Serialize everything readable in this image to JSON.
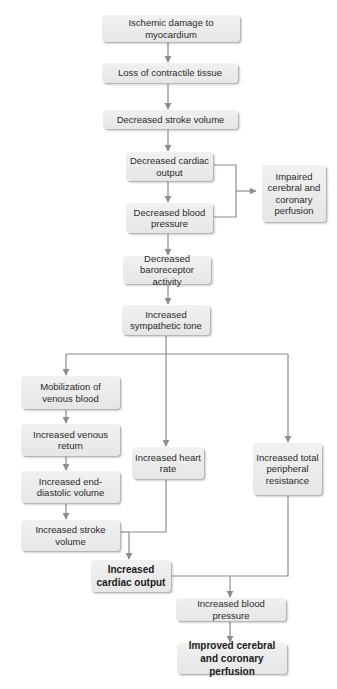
{
  "diagram": {
    "title": "",
    "colors": {
      "box_fill": "#ececec",
      "line": "#8c8c8c",
      "text": "#2a2a2a"
    },
    "nodes": {
      "ischemic_damage": "Ischemic damage to myocardium",
      "loss_contractile": "Loss of contractile tissue",
      "dec_stroke_volume": "Decreased stroke volume",
      "dec_cardiac_output": "Decreased cardiac output",
      "dec_blood_pressure": "Decreased blood pressure",
      "impaired_perfusion": "Impaired cerebral and coronary perfusion",
      "dec_baroreceptor": "Decreased baroreceptor activity",
      "inc_sympathetic": "Increased sympathetic tone",
      "mobilization_venous": "Mobilization of venous blood",
      "inc_venous_return": "Increased venous return",
      "inc_edv": "Increased end-diastolic volume",
      "inc_stroke_volume": "Increased stroke volume",
      "inc_heart_rate": "Increased heart rate",
      "inc_tpr": "Increased total peripheral resistance",
      "inc_cardiac_output": "Increased cardiac output",
      "inc_blood_pressure": "Increased blood pressure",
      "improved_perfusion": "Improved cerebral and coronary perfusion"
    },
    "edges": [
      [
        "ischemic_damage",
        "loss_contractile"
      ],
      [
        "loss_contractile",
        "dec_stroke_volume"
      ],
      [
        "dec_stroke_volume",
        "dec_cardiac_output"
      ],
      [
        "dec_cardiac_output",
        "dec_blood_pressure"
      ],
      [
        "dec_cardiac_output",
        "impaired_perfusion"
      ],
      [
        "dec_blood_pressure",
        "impaired_perfusion"
      ],
      [
        "dec_blood_pressure",
        "dec_baroreceptor"
      ],
      [
        "dec_baroreceptor",
        "inc_sympathetic"
      ],
      [
        "inc_sympathetic",
        "mobilization_venous"
      ],
      [
        "inc_sympathetic",
        "inc_heart_rate"
      ],
      [
        "inc_sympathetic",
        "inc_tpr"
      ],
      [
        "mobilization_venous",
        "inc_venous_return"
      ],
      [
        "inc_venous_return",
        "inc_edv"
      ],
      [
        "inc_edv",
        "inc_stroke_volume"
      ],
      [
        "inc_stroke_volume",
        "inc_cardiac_output"
      ],
      [
        "inc_heart_rate",
        "inc_cardiac_output"
      ],
      [
        "inc_cardiac_output",
        "inc_blood_pressure"
      ],
      [
        "inc_tpr",
        "inc_blood_pressure"
      ],
      [
        "inc_blood_pressure",
        "improved_perfusion"
      ]
    ]
  }
}
